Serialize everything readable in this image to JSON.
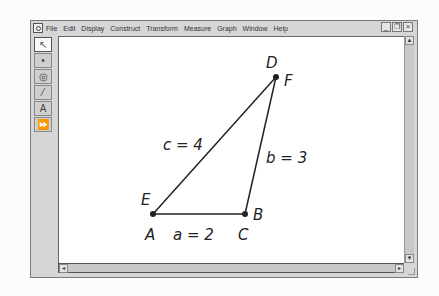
{
  "menubar": {
    "items": [
      "File",
      "Edit",
      "Display",
      "Construct",
      "Transform",
      "Measure",
      "Graph",
      "Window",
      "Help"
    ]
  },
  "window_controls": {
    "minimize": "_",
    "restore": "❐",
    "close": "×"
  },
  "toolbox": {
    "tools": [
      {
        "name": "arrow-tool",
        "glyph": "↖"
      },
      {
        "name": "point-tool",
        "glyph": "•"
      },
      {
        "name": "compass-tool",
        "glyph": "◎"
      },
      {
        "name": "straightedge-tool",
        "glyph": "⁄"
      },
      {
        "name": "text-tool",
        "glyph": "A"
      },
      {
        "name": "custom-tool",
        "glyph": "⏩"
      }
    ]
  },
  "scrollbars": {
    "up": "▲",
    "down": "▼",
    "left": "◂",
    "right": "▸"
  },
  "figure": {
    "points": {
      "A": {
        "x": 153,
        "y": 214
      },
      "C": {
        "x": 245,
        "y": 214
      },
      "F": {
        "x": 276,
        "y": 77
      }
    },
    "labels": {
      "D": "D",
      "F": "F",
      "E": "E",
      "A": "A",
      "B": "B",
      "C": "C",
      "side_c": "c = 4",
      "side_b": "b = 3",
      "side_a": "a = 2"
    }
  }
}
